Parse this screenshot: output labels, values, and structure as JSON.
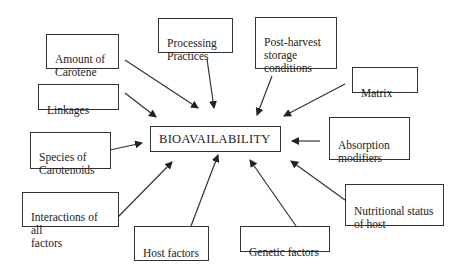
{
  "diagram": {
    "center": {
      "label": "BIOAVAILABILITY"
    },
    "factors": [
      {
        "id": "amount-of-carotene",
        "label": "Amount of\nCarotene"
      },
      {
        "id": "processing-practices",
        "label": "Processing\nPractices"
      },
      {
        "id": "post-harvest-storage",
        "label": "Post-harvest\nstorage\nconditions"
      },
      {
        "id": "matrix",
        "label": "Matrix"
      },
      {
        "id": "linkages",
        "label": "Linkages"
      },
      {
        "id": "absorption-modifiers",
        "label": "Absorption\nmodifiers"
      },
      {
        "id": "species-of-carotenoids",
        "label": "Species of\nCarotenoids"
      },
      {
        "id": "interactions",
        "label": "Interactions of all\nfactors"
      },
      {
        "id": "nutritional-status",
        "label": "Nutritional status\nof host"
      },
      {
        "id": "host-factors",
        "label": "Host factors"
      },
      {
        "id": "genetic-factors",
        "label": "Genetic factors"
      }
    ],
    "colors": {
      "line": "#333333",
      "background": "#ffffff",
      "text": "#222222"
    }
  }
}
